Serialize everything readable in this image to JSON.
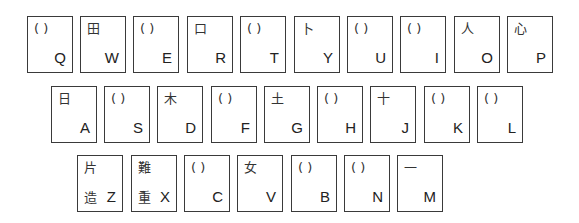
{
  "keyboard": {
    "rows": [
      {
        "keys": [
          {
            "letter": "Q",
            "radical": "(   )"
          },
          {
            "letter": "W",
            "radical": "田"
          },
          {
            "letter": "E",
            "radical": "(   )"
          },
          {
            "letter": "R",
            "radical": "口"
          },
          {
            "letter": "T",
            "radical": "(   )"
          },
          {
            "letter": "Y",
            "radical": "卜"
          },
          {
            "letter": "U",
            "radical": "(   )"
          },
          {
            "letter": "I",
            "radical": "(   )"
          },
          {
            "letter": "O",
            "radical": "人"
          },
          {
            "letter": "P",
            "radical": "心"
          }
        ]
      },
      {
        "keys": [
          {
            "letter": "A",
            "radical": "日"
          },
          {
            "letter": "S",
            "radical": "(   )"
          },
          {
            "letter": "D",
            "radical": "木"
          },
          {
            "letter": "F",
            "radical": "(   )"
          },
          {
            "letter": "G",
            "radical": "土"
          },
          {
            "letter": "H",
            "radical": "(   )"
          },
          {
            "letter": "J",
            "radical": "十"
          },
          {
            "letter": "K",
            "radical": "(   )"
          },
          {
            "letter": "L",
            "radical": "(   )"
          }
        ]
      },
      {
        "keys": [
          {
            "letter": "Z",
            "radical": "片",
            "radical_bottom": "造"
          },
          {
            "letter": "X",
            "radical": "難",
            "radical_bottom": "重"
          },
          {
            "letter": "C",
            "radical": "(   )"
          },
          {
            "letter": "V",
            "radical": "女"
          },
          {
            "letter": "B",
            "radical": "(   )"
          },
          {
            "letter": "N",
            "radical": "(   )"
          },
          {
            "letter": "M",
            "radical": "一"
          }
        ]
      }
    ]
  }
}
